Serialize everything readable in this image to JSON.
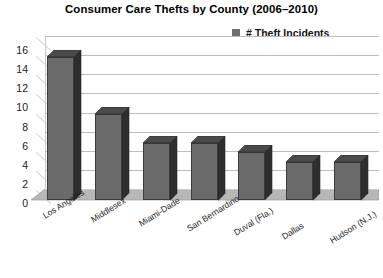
{
  "chart_data": {
    "type": "bar",
    "title": "Consumer Care Thefts by County (2006–2010)",
    "xlabel": "",
    "ylabel": "",
    "ylim": [
      0,
      16
    ],
    "ytick_step": 2,
    "yticks": [
      16,
      14,
      12,
      10,
      8,
      6,
      4,
      2,
      0
    ],
    "grid": true,
    "legend_position": "top-right",
    "style": "3d-column",
    "categories": [
      "Los Angeles",
      "Middlesex",
      "Miami-Dade",
      "San Bernardino",
      "Duval (Fla.)",
      "Dallas",
      "Hudson (N.J.)"
    ],
    "series": [
      {
        "name": "# Theft Incidents",
        "color": "#6b6b6b",
        "values": [
          15,
          9,
          6,
          6,
          5,
          4,
          4
        ]
      }
    ]
  },
  "legend": {
    "entries": [
      {
        "label": "# Theft Incidents",
        "color": "#6b6b6b"
      }
    ]
  },
  "colors": {
    "bar_face": "#6b6b6b",
    "bar_side": "#2e2e2e",
    "bar_top": "#4a4a4a",
    "gridline": "#bdbdbd",
    "floor": "#b7b7b7",
    "text": "#1a1a1a",
    "background": "#ffffff"
  }
}
